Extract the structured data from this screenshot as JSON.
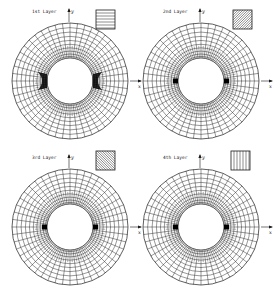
{
  "figure": {
    "panels": [
      {
        "id": "layer-1",
        "title": "1st Layer",
        "cx": 70,
        "cy": 81,
        "legend_x": 96,
        "legend_y": 10,
        "fiber": "horizontal",
        "fiber_angle_deg": 0,
        "shading": "heavy",
        "y_axis_label": "y",
        "x_axis_label": "x"
      },
      {
        "id": "layer-2",
        "title": "2nd Layer",
        "cx": 201,
        "cy": 81,
        "legend_x": 233,
        "legend_y": 10,
        "fiber": "diagonal-45",
        "fiber_angle_deg": 45,
        "shading": "light",
        "y_axis_label": "y",
        "x_axis_label": "x"
      },
      {
        "id": "layer-3",
        "title": "3rd Layer",
        "cx": 70,
        "cy": 227,
        "legend_x": 96,
        "legend_y": 151,
        "fiber": "diagonal-neg45",
        "fiber_angle_deg": -45,
        "shading": "light",
        "y_axis_label": "y",
        "x_axis_label": "x"
      },
      {
        "id": "layer-4",
        "title": "4th Layer",
        "cx": 201,
        "cy": 227,
        "legend_x": 231,
        "legend_y": 151,
        "fiber": "vertical",
        "fiber_angle_deg": 90,
        "shading": "light",
        "y_axis_label": "y",
        "x_axis_label": "x"
      }
    ],
    "mesh": {
      "outer_radius": 58,
      "inner_radius": 23,
      "radial_divisions": 48,
      "ring_count": 10
    },
    "colors": {
      "line": "#1a1a1a",
      "background": "#ffffff",
      "damage": "#000000"
    }
  }
}
